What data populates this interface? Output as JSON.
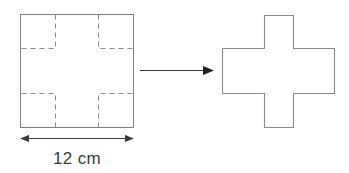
{
  "figure": {
    "title_caption": "",
    "source_square": {
      "name": "square-with-corner-cutouts",
      "side_label": "12 cm",
      "side_length_value": 12,
      "units": "cm",
      "outline_color": "#808080",
      "cut_line_color": "#8c8c8c",
      "cut_line_style": "dashed",
      "corner_cutouts": 4,
      "cutout_fraction_of_side": 0.3
    },
    "dimension": {
      "name": "width-dimension",
      "label": "12 cm",
      "arrow_style": "double-headed",
      "color": "#3a3a3a"
    },
    "transform_arrow": {
      "name": "transform-arrow",
      "direction": "right",
      "label": "",
      "color": "#3a3a3a"
    },
    "result_shape": {
      "name": "cross-shape",
      "shape_type": "plus",
      "outline_color": "#8a8a8a",
      "fill": "none"
    }
  }
}
